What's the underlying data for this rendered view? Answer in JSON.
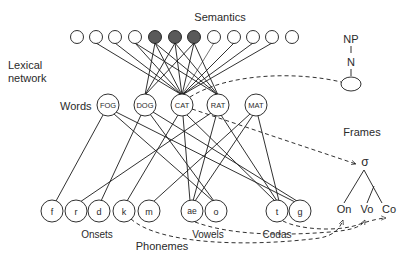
{
  "labels": {
    "semantics": "Semantics",
    "lexical_network_line1": "Lexical",
    "lexical_network_line2": "network",
    "words": "Words",
    "frames": "Frames",
    "onsets": "Onsets",
    "vowels": "Vowels",
    "codas": "Codas",
    "phonemes": "Phonemes"
  },
  "semantic_nodes": [
    {
      "x": 77,
      "filled": false
    },
    {
      "x": 96,
      "filled": false
    },
    {
      "x": 115,
      "filled": false
    },
    {
      "x": 135,
      "filled": false
    },
    {
      "x": 155,
      "filled": true
    },
    {
      "x": 175,
      "filled": true
    },
    {
      "x": 194,
      "filled": true
    },
    {
      "x": 214,
      "filled": false
    },
    {
      "x": 234,
      "filled": false
    },
    {
      "x": 253,
      "filled": false
    },
    {
      "x": 272,
      "filled": false
    },
    {
      "x": 292,
      "filled": false
    }
  ],
  "word_nodes": [
    {
      "label": "FOG",
      "x": 108
    },
    {
      "label": "DOG",
      "x": 145
    },
    {
      "label": "CAT",
      "x": 182
    },
    {
      "label": "RAT",
      "x": 218
    },
    {
      "label": "MAT",
      "x": 256
    }
  ],
  "phoneme_nodes": [
    {
      "label": "f",
      "x": 52
    },
    {
      "label": "r",
      "x": 76
    },
    {
      "label": "d",
      "x": 99
    },
    {
      "label": "k",
      "x": 124
    },
    {
      "label": "m",
      "x": 149
    },
    {
      "label": "ae",
      "x": 192
    },
    {
      "label": "o",
      "x": 216
    },
    {
      "label": "t",
      "x": 277
    },
    {
      "label": "g",
      "x": 300
    }
  ],
  "frame_tree": {
    "np": "NP",
    "n": "N",
    "sigma": "σ",
    "onset": "On",
    "vowel": "Vo",
    "coda": "Co"
  },
  "colors": {
    "line": "#1a1a1a",
    "filled_node": "#5a5a5a",
    "text": "#2a2a2a"
  }
}
